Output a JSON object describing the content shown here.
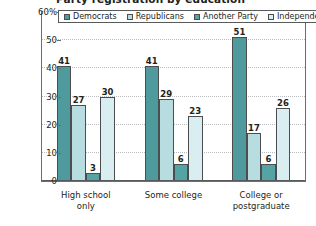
{
  "chart_data": {
    "type": "bar",
    "title": "Party registration by education",
    "xlabel": "",
    "ylabel": "",
    "ylim": [
      0,
      60
    ],
    "yticks": [
      0,
      10,
      20,
      30,
      40,
      50,
      60
    ],
    "ytick_labels": [
      "0",
      "10",
      "20",
      "30",
      "40",
      "50",
      "60%"
    ],
    "grid": true,
    "legend_position": "top-inside",
    "categories": [
      "High school only",
      "Some college",
      "College or postgraduate"
    ],
    "category_lines": [
      [
        "High school",
        "only"
      ],
      [
        "Some college",
        ""
      ],
      [
        "College or",
        "postgraduate"
      ]
    ],
    "series": [
      {
        "name": "Democrats",
        "color": "#4e9a9c",
        "values": [
          41,
          41,
          51
        ]
      },
      {
        "name": "Republicans",
        "color": "#b7dde0",
        "values": [
          27,
          29,
          17
        ]
      },
      {
        "name": "Another Party",
        "color": "#56a3a6",
        "values": [
          3,
          6,
          6
        ]
      },
      {
        "name": "Independents",
        "color": "#d8eef0",
        "values": [
          30,
          23,
          26
        ]
      }
    ]
  }
}
